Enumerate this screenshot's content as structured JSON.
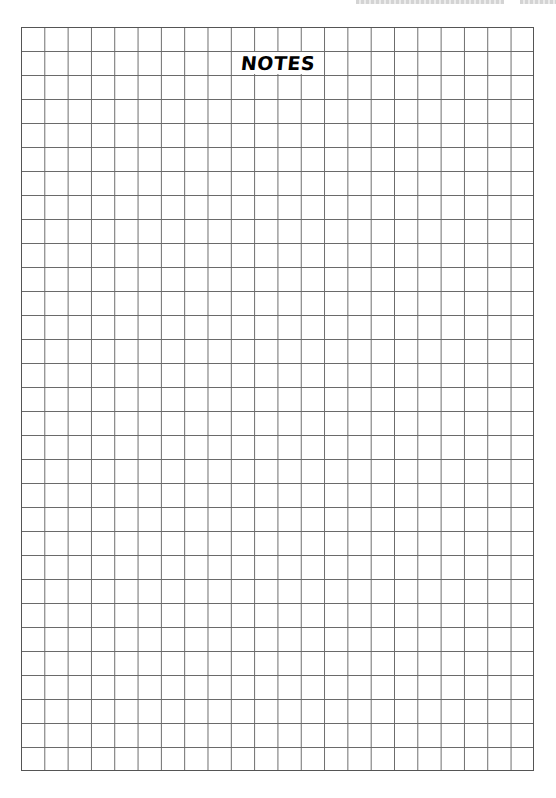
{
  "page": {
    "title": "NOTES",
    "grid": {
      "columns": 22,
      "rows": 31,
      "line_color": "#6a6a6a",
      "background_color": "#ffffff"
    },
    "header": {
      "cropped": true
    }
  }
}
